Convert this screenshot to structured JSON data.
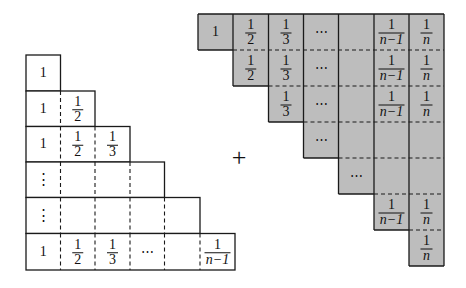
{
  "diagram": {
    "left_staircase": {
      "description": "Staircase of rows, row k has k cells",
      "rows": [
        [
          "1"
        ],
        [
          "1",
          "1/2"
        ],
        [
          "1",
          "1/2",
          "1/3"
        ],
        [
          "⋮",
          "",
          "",
          ""
        ],
        [
          "⋮",
          "",
          "",
          "",
          ""
        ],
        [
          "1",
          "1/2",
          "1/3",
          "⋯",
          "",
          "1/(n−1)"
        ]
      ],
      "fill": "#ffffff"
    },
    "operator": "+",
    "right_staircase": {
      "description": "Inverted staircase, shaded gray",
      "rows": [
        [
          "1",
          "1/2",
          "1/3",
          "⋯",
          "",
          "1/(n−1)",
          "1/n"
        ],
        [
          "1/2",
          "1/3",
          "⋯",
          "",
          "1/(n−1)",
          "1/n"
        ],
        [
          "1/3",
          "⋯",
          "",
          "1/(n−1)",
          "1/n"
        ],
        [
          "⋯",
          "",
          "",
          ""
        ],
        [
          "⋯",
          "",
          ""
        ],
        [
          "1/(n−1)",
          "1/n"
        ],
        [
          "1/n"
        ]
      ],
      "fill": "#bdbdbd"
    },
    "colors": {
      "stroke": "#1a1a1a",
      "gray_fill": "#bdbdbd",
      "background": "#ffffff"
    }
  }
}
